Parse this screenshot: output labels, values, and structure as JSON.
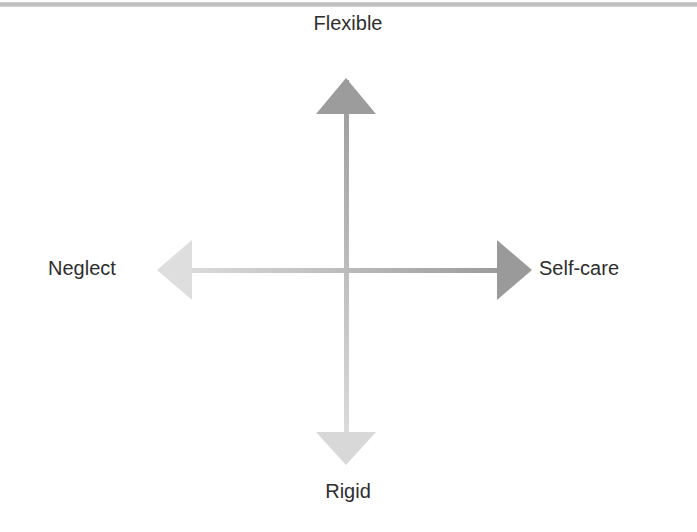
{
  "diagram": {
    "type": "two-axis quadrant",
    "axes": {
      "vertical": {
        "top_label": "Flexible",
        "bottom_label": "Rigid"
      },
      "horizontal": {
        "left_label": "Neglect",
        "right_label": "Self-care"
      }
    },
    "colors": {
      "dark_end": "#9a9a9a",
      "light_end": "#dcdcdc",
      "label_text": "#2e2e2e",
      "top_band": "#c4c4c4"
    }
  }
}
